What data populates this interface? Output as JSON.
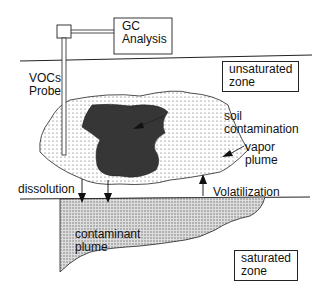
{
  "diagram": {
    "instrument": {
      "label_line1": "GC",
      "label_line2": "Analysis"
    },
    "probe": {
      "label_line1": "VOCs",
      "label_line2": "Probe"
    },
    "zones": {
      "unsaturated": {
        "line1": "unsaturated",
        "line2": "zone"
      },
      "saturated": {
        "line1": "saturated",
        "line2": "zone"
      }
    },
    "labels": {
      "soil_contamination_1": "soil",
      "soil_contamination_2": "contamination",
      "vapor_plume_1": "vapor",
      "vapor_plume_2": "plume",
      "dissolution": "dissolution",
      "volatilization": "Volatilization",
      "contaminant_plume_1": "contaminant",
      "contaminant_plume_2": "plume"
    },
    "colors": {
      "line": "#222222",
      "dark_fill": "#333333",
      "dot": "#555555"
    }
  }
}
